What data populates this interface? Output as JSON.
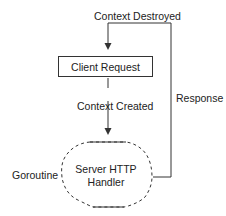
{
  "diagram": {
    "labels": {
      "context_destroyed": "Context Destroyed",
      "context_created": "Context Created",
      "response": "Response",
      "goroutine": "Goroutine"
    },
    "nodes": {
      "client_request": "Client Request",
      "server_handler_line1": "Server HTTP",
      "server_handler_line2": "Handler"
    },
    "edges": [
      {
        "from": "Client Request",
        "to": "Server HTTP Handler",
        "label": "Context Created"
      },
      {
        "from": "Server HTTP Handler",
        "to": "Client Request",
        "label": "Response / Context Destroyed"
      }
    ]
  }
}
